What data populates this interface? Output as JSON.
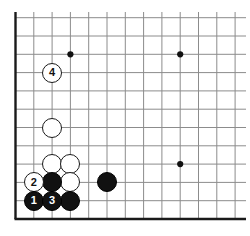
{
  "figure": {
    "name": "go-board-diagram",
    "type": "go-game-diagram",
    "board_view": "bottom-left-corner",
    "background_color": "#ffffff",
    "line_color": "#8c8c8c",
    "border_color": "#1a1a1a",
    "black_color": "#111111",
    "white_color": "#ffffff"
  },
  "board": {
    "origin_x": 15.5,
    "origin_y": 18,
    "spacing": 18.3,
    "cols": 13,
    "rows": 12,
    "left_edge_x": 15.5,
    "bottom_edge_y": 219,
    "top_line_y": 18,
    "right_line_x": 235,
    "star_points": [
      {
        "name": "star-point-upper-left",
        "col": 4,
        "row": 10
      },
      {
        "name": "star-point-upper-right",
        "col": 10,
        "row": 10
      },
      {
        "name": "star-point-lower-right",
        "col": 10,
        "row": 4
      }
    ]
  },
  "stones": [
    {
      "id": "white-stone-a",
      "color": "white",
      "label": "",
      "col": 3,
      "row": 6
    },
    {
      "id": "white-stone-b",
      "color": "white",
      "label": "",
      "col": 3,
      "row": 4
    },
    {
      "id": "white-stone-c",
      "color": "white",
      "label": "",
      "col": 4,
      "row": 4
    },
    {
      "id": "white-stone-d",
      "color": "white",
      "label": "",
      "col": 4,
      "row": 3
    },
    {
      "id": "black-stone-a",
      "color": "black",
      "label": "",
      "col": 3,
      "row": 3
    },
    {
      "id": "black-stone-b",
      "color": "black",
      "label": "",
      "col": 6,
      "row": 3
    },
    {
      "id": "black-stone-c",
      "color": "black",
      "label": "",
      "col": 4,
      "row": 2
    },
    {
      "id": "move-2",
      "color": "white",
      "label": "2",
      "col": 2,
      "row": 3
    },
    {
      "id": "move-1",
      "color": "black",
      "label": "1",
      "col": 2,
      "row": 2
    },
    {
      "id": "move-3",
      "color": "black",
      "label": "3",
      "col": 3,
      "row": 2
    },
    {
      "id": "move-4",
      "color": "white",
      "label": "4",
      "col": 3,
      "row": 9
    }
  ],
  "move_sequence": [
    {
      "number": "1",
      "color": "black"
    },
    {
      "number": "2",
      "color": "white"
    },
    {
      "number": "3",
      "color": "black"
    },
    {
      "number": "4",
      "color": "white"
    }
  ]
}
